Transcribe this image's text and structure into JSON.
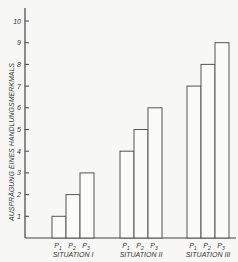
{
  "chart_data": {
    "type": "bar",
    "title": "",
    "ylabel": "AUSPRÄGUNG EINES HANDLUNGSMERKMALS",
    "xlabel": "",
    "ylim": [
      0,
      10
    ],
    "yticks": [
      1,
      2,
      3,
      4,
      5,
      6,
      7,
      8,
      9,
      10
    ],
    "grid": false,
    "legend": null,
    "groups": [
      {
        "label": "SITUATION I",
        "bars": [
          {
            "label": "P1",
            "value": 1
          },
          {
            "label": "P2",
            "value": 2
          },
          {
            "label": "P3",
            "value": 3
          }
        ]
      },
      {
        "label": "SITUATION II",
        "bars": [
          {
            "label": "P1",
            "value": 4
          },
          {
            "label": "P2",
            "value": 5
          },
          {
            "label": "P3",
            "value": 6
          }
        ]
      },
      {
        "label": "SITUATION III",
        "bars": [
          {
            "label": "P1",
            "value": 7
          },
          {
            "label": "P2",
            "value": 8
          },
          {
            "label": "P3",
            "value": 9
          }
        ]
      }
    ],
    "categories": [
      "SITUATION I",
      "SITUATION II",
      "SITUATION III"
    ],
    "series": [
      {
        "name": "P1",
        "values": [
          1,
          4,
          7
        ]
      },
      {
        "name": "P2",
        "values": [
          2,
          5,
          8
        ]
      },
      {
        "name": "P3",
        "values": [
          3,
          6,
          9
        ]
      }
    ]
  }
}
